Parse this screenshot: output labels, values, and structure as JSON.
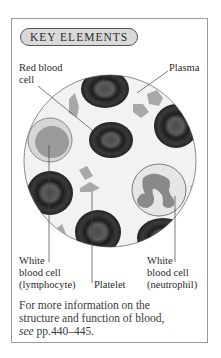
{
  "panel": {
    "title": "KEY ELEMENTS",
    "labels": {
      "red_blood_cell_l1": "Red blood",
      "red_blood_cell_l2": "cell",
      "plasma": "Plasma",
      "lymphocyte_l1": "White",
      "lymphocyte_l2": "blood cell",
      "lymphocyte_l3": "(lymphocyte)",
      "platelet": "Platelet",
      "neutrophil_l1": "White",
      "neutrophil_l2": "blood cell",
      "neutrophil_l3": "(neutrophil)"
    },
    "footer": {
      "line1": "For more information on the",
      "line2": "structure and function of blood,",
      "see": "see",
      "pages": " pp.440–445."
    }
  }
}
